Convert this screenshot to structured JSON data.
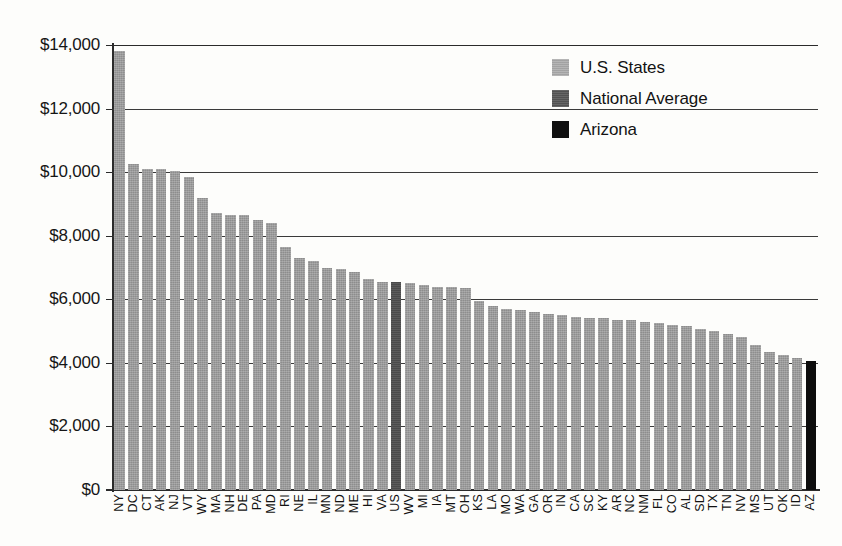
{
  "chart_data": {
    "type": "bar",
    "title": "",
    "subtitle": "",
    "xlabel": "",
    "ylabel": "",
    "ylim": [
      0,
      14000
    ],
    "ytick_values": [
      0,
      2000,
      4000,
      6000,
      8000,
      10000,
      12000,
      14000
    ],
    "ytick_labels": [
      "$0",
      "$2,000",
      "$4,000",
      "$6,000",
      "$8,000",
      "$10,000",
      "$12,000",
      "$14,000"
    ],
    "grid": true,
    "legend_position": "top-right",
    "categories": [
      "NY",
      "DC",
      "CT",
      "AK",
      "NJ",
      "VT",
      "WY",
      "MA",
      "NH",
      "DE",
      "PA",
      "MD",
      "RI",
      "NE",
      "IL",
      "MN",
      "ND",
      "ME",
      "HI",
      "VA",
      "US",
      "WV",
      "MI",
      "IA",
      "MT",
      "OH",
      "KS",
      "LA",
      "MO",
      "WA",
      "GA",
      "OR",
      "IN",
      "CA",
      "SC",
      "KY",
      "AR",
      "NC",
      "NM",
      "FL",
      "CO",
      "AL",
      "SD",
      "TX",
      "TN",
      "NV",
      "MS",
      "UT",
      "OK",
      "ID",
      "AZ"
    ],
    "values": [
      13800,
      10250,
      10100,
      10100,
      10050,
      9850,
      9200,
      8700,
      8650,
      8650,
      8500,
      8400,
      7650,
      7300,
      7200,
      7000,
      6950,
      6850,
      6650,
      6550,
      6550,
      6500,
      6450,
      6400,
      6400,
      6350,
      5950,
      5800,
      5700,
      5650,
      5600,
      5550,
      5500,
      5450,
      5400,
      5400,
      5350,
      5350,
      5300,
      5250,
      5200,
      5150,
      5050,
      5000,
      4900,
      4800,
      4550,
      4350,
      4250,
      4150,
      4050
    ],
    "series_classes": [
      "states",
      "states",
      "states",
      "states",
      "states",
      "states",
      "states",
      "states",
      "states",
      "states",
      "states",
      "states",
      "states",
      "states",
      "states",
      "states",
      "states",
      "states",
      "states",
      "states",
      "national",
      "states",
      "states",
      "states",
      "states",
      "states",
      "states",
      "states",
      "states",
      "states",
      "states",
      "states",
      "states",
      "states",
      "states",
      "states",
      "states",
      "states",
      "states",
      "states",
      "states",
      "states",
      "states",
      "states",
      "states",
      "states",
      "states",
      "states",
      "states",
      "states",
      "highlight"
    ],
    "legend": [
      {
        "label": "U.S. States",
        "swatch": "states",
        "color": "#ababab"
      },
      {
        "label": "National Average",
        "swatch": "national",
        "color": "#575757"
      },
      {
        "label": "Arizona",
        "swatch": "highlight",
        "color": "#101010"
      }
    ],
    "colors": {
      "states": "#9b9b9b",
      "national": "#4f4f4f",
      "highlight": "#0d0d0d",
      "axis": "#2b2b2b",
      "grid": "#3a3a3a",
      "background": "#fdfdfb"
    }
  }
}
